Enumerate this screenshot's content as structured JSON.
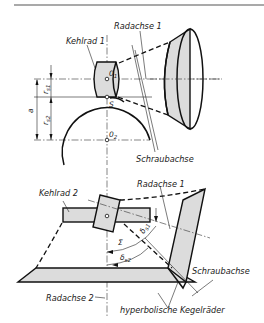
{
  "figure": {
    "top_diagram": {
      "labels": {
        "wheel_axis_1": "Radachse 1",
        "throat_wheel_1": "Kehlrad 1",
        "helix_axis": "Schraubachse",
        "center_1": "0",
        "center_1_sub": "1",
        "center_2": "0",
        "center_2_sub": "2",
        "pitch_point": "S",
        "dim_a": "a",
        "dim_rs1": "r",
        "dim_rs1_sub": "s1",
        "dim_rs2": "r",
        "dim_rs2_sub": "s2"
      }
    },
    "bottom_diagram": {
      "labels": {
        "throat_wheel_2": "Kehlrad 2",
        "wheel_axis_1": "Radachse 1",
        "wheel_axis_2": "Radachse 2",
        "helix_axis": "Schraubachse",
        "hyperbolic_bevel_gears": "hyperbolische Kegelräder",
        "sigma": "Σ",
        "delta_s1": "δ",
        "delta_s1_sub": "s1",
        "delta_s2": "δ",
        "delta_s2_sub": "s2"
      }
    },
    "colors": {
      "line": "#111111",
      "shade": "#dcdcdc",
      "background": "#ffffff"
    }
  }
}
